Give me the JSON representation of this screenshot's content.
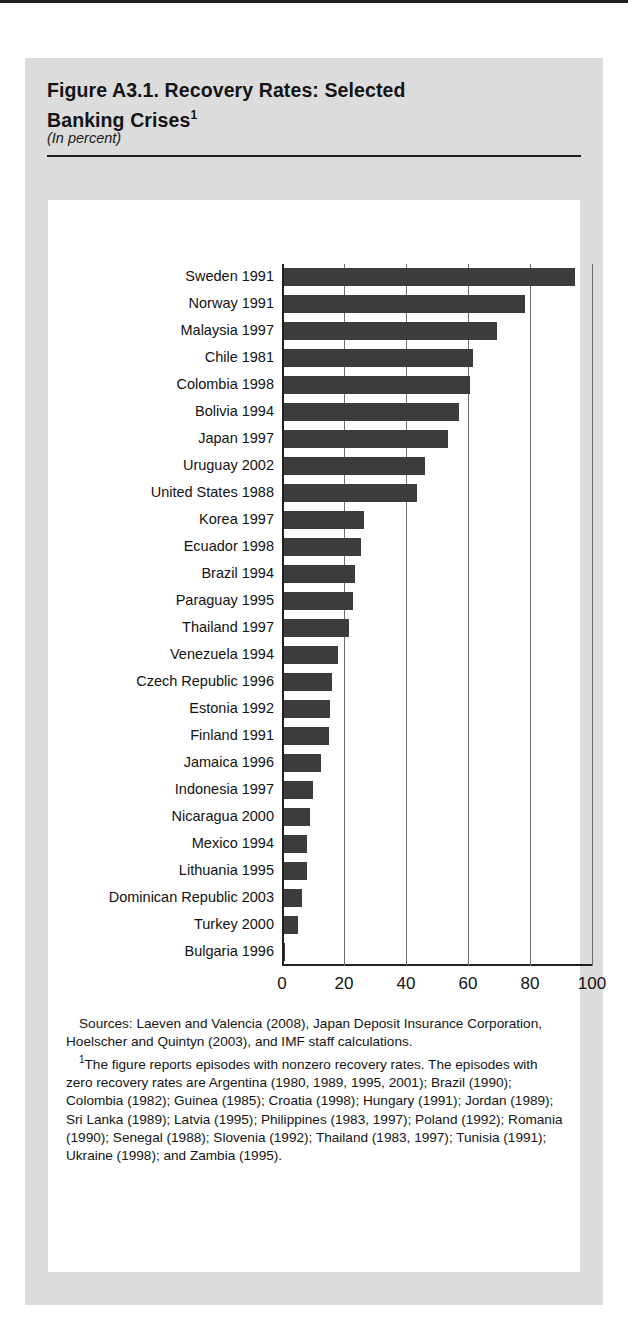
{
  "figure": {
    "title_line1": "Figure A3.1.  Recovery Rates: Selected",
    "title_line2": "Banking Crises",
    "title_footnote_marker": "1",
    "subtitle": "(In percent)"
  },
  "notes": {
    "sources_label": "Sources:",
    "sources_text": "Laeven and Valencia (2008), Japan Deposit Insurance Corporation, Hoelscher and Quintyn (2003), and IMF staff calculations.",
    "footnote_marker": "1",
    "footnote_text": "The figure reports episodes with nonzero recovery rates. The episodes with zero recovery rates are Argentina (1980, 1989, 1995, 2001); Brazil (1990); Colombia (1982); Guinea (1985); Croatia (1998); Hungary (1991); Jordan (1989); Sri Lanka (1989); Latvia (1995); Philippines (1983, 1997); Poland (1992); Romania (1990); Senegal (1988); Slovenia (1992); Thailand (1983, 1997); Tunisia (1991); Ukraine (1998); and Zambia (1995)."
  },
  "chart_data": {
    "type": "bar",
    "orientation": "horizontal",
    "title": "Figure A3.1.  Recovery Rates: Selected Banking Crises",
    "subtitle": "(In percent)",
    "xlabel": "",
    "ylabel": "",
    "xlim": [
      0,
      100
    ],
    "grid": true,
    "legend": "none",
    "bar_color": "#3c3c3c",
    "xticks": [
      0,
      20,
      40,
      60,
      80,
      100
    ],
    "xtick_labels": [
      "0",
      "20",
      "40",
      "60",
      "80",
      "100"
    ],
    "categories": [
      "Sweden 1991",
      "Norway 1991",
      "Malaysia 1997",
      "Chile 1981",
      "Colombia 1998",
      "Bolivia 1994",
      "Japan 1997",
      "Uruguay 2002",
      "United States 1988",
      "Korea 1997",
      "Ecuador 1998",
      "Brazil 1994",
      "Paraguay 1995",
      "Thailand 1997",
      "Venezuela 1994",
      "Czech Republic 1996",
      "Estonia 1992",
      "Finland 1991",
      "Jamaica 1996",
      "Indonesia 1997",
      "Nicaragua 2000",
      "Mexico 1994",
      "Lithuania 1995",
      "Dominican Republic 2003",
      "Turkey 2000",
      "Bulgaria 1996"
    ],
    "values": [
      94,
      78,
      69,
      61,
      60,
      56.5,
      53,
      45.5,
      43,
      26,
      25,
      23,
      22.5,
      21,
      17.5,
      15.5,
      15,
      14.5,
      12,
      9.5,
      8.5,
      7.5,
      7.5,
      6,
      4.5,
      0.4
    ]
  }
}
